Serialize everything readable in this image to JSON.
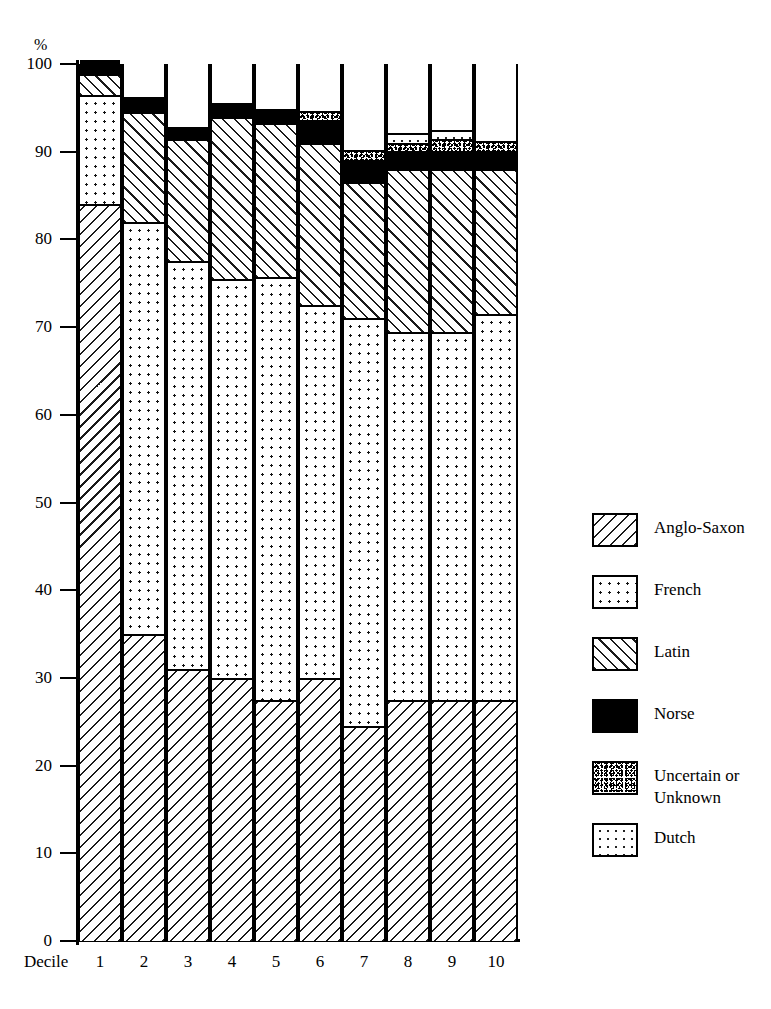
{
  "axes": {
    "y_unit": "%",
    "y_ticks": [
      "0",
      "10",
      "20",
      "30",
      "40",
      "50",
      "60",
      "70",
      "80",
      "90",
      "100"
    ],
    "x_axis_title": "Decile",
    "x_ticks": [
      "1",
      "2",
      "3",
      "4",
      "5",
      "6",
      "7",
      "8",
      "9",
      "10"
    ]
  },
  "legend": {
    "items": [
      {
        "label": "Anglo-Saxon",
        "pattern": "diagonal-backslash-hatch"
      },
      {
        "label": "French",
        "pattern": "dot-grid"
      },
      {
        "label": "Latin",
        "pattern": "diagonal-slash-hatch"
      },
      {
        "label": "Norse",
        "pattern": "solid-black"
      },
      {
        "label": "Uncertain or\nUnknown",
        "pattern": "dense-speckle"
      },
      {
        "label": "Dutch",
        "pattern": "sparse-dot"
      }
    ]
  },
  "chart_data": {
    "type": "bar",
    "title": "",
    "subtitle": "",
    "xlabel": "Decile",
    "ylabel": "%",
    "ylim": [
      0,
      100
    ],
    "ytick_step": 10,
    "grid": false,
    "stacked": true,
    "legend_position": "right",
    "categories": [
      "1",
      "2",
      "3",
      "4",
      "5",
      "6",
      "7",
      "8",
      "9",
      "10"
    ],
    "series": [
      {
        "name": "Anglo-Saxon",
        "values": [
          84.0,
          35.0,
          31.0,
          30.0,
          27.5,
          30.0,
          24.5,
          27.5,
          27.5,
          27.5
        ]
      },
      {
        "name": "French",
        "values": [
          12.5,
          47.0,
          46.5,
          45.5,
          48.2,
          42.5,
          46.5,
          42.0,
          42.0,
          44.0
        ]
      },
      {
        "name": "Latin",
        "values": [
          2.4,
          12.5,
          13.9,
          18.5,
          17.6,
          18.5,
          15.5,
          18.5,
          18.5,
          16.5
        ]
      },
      {
        "name": "Norse",
        "values": [
          1.6,
          1.7,
          1.4,
          1.6,
          1.6,
          2.6,
          2.6,
          2.1,
          2.1,
          2.1
        ]
      },
      {
        "name": "Uncertain or Unknown",
        "values": [
          0.0,
          0.0,
          0.0,
          0.0,
          0.0,
          1.1,
          1.1,
          0.9,
          1.4,
          1.1
        ]
      },
      {
        "name": "Dutch",
        "values": [
          0.4,
          0.0,
          0.0,
          0.0,
          0.0,
          0.0,
          0.0,
          1.1,
          1.0,
          0.0
        ]
      }
    ],
    "cumulative_tops": {
      "note": "cumulative % at the top of each stacked segment, bottom-to-top",
      "Anglo-Saxon": [
        84.0,
        35.0,
        31.0,
        30.0,
        27.5,
        30.0,
        24.5,
        27.5,
        27.5,
        27.5
      ],
      "French": [
        96.5,
        82.0,
        77.5,
        75.5,
        75.7,
        72.5,
        71.0,
        69.5,
        69.5,
        71.5
      ],
      "Latin": [
        98.9,
        94.5,
        91.4,
        94.0,
        93.3,
        91.0,
        86.5,
        88.0,
        88.0,
        88.0
      ],
      "Norse": [
        100.0,
        96.2,
        92.8,
        95.6,
        94.9,
        93.6,
        89.1,
        90.1,
        90.1,
        90.1
      ],
      "Uncertain": [
        100.0,
        96.2,
        92.8,
        95.6,
        94.9,
        94.7,
        90.2,
        91.0,
        91.5,
        91.2
      ],
      "Dutch": [
        100.0,
        100.0,
        100.0,
        100.0,
        100.0,
        100.0,
        100.0,
        100.0,
        100.0,
        100.0
      ]
    }
  }
}
